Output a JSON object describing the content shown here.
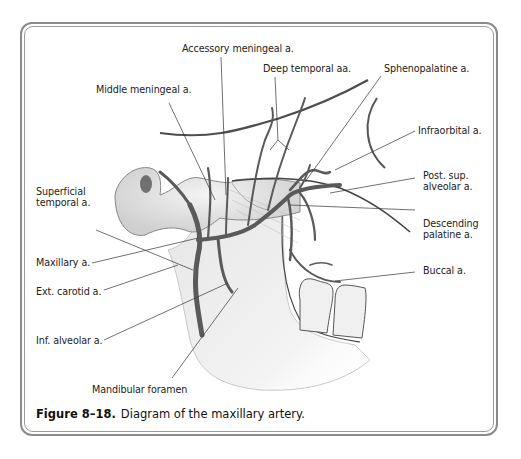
{
  "figure": {
    "number": "Figure 8–18.",
    "caption": "Diagram of the maxillary artery."
  },
  "labels": {
    "accessory_meningeal": "Accessory meningeal a.",
    "deep_temporal": "Deep temporal aa.",
    "sphenopalatine": "Sphenopalatine a.",
    "middle_meningeal": "Middle meningeal a.",
    "infraorbital": "Infraorbital a.",
    "post_sup_alveolar": "Post. sup.\nalveolar a.",
    "superficial_temporal": "Superficial\ntemporal a.",
    "descending_palatine": "Descending\npalatine a.",
    "maxillary": "Maxillary a.",
    "buccal": "Buccal a.",
    "ext_carotid": "Ext. carotid a.",
    "inf_alveolar": "Inf. alveolar a.",
    "mandibular_foramen": "Mandibular foramen"
  },
  "colors": {
    "frame": "#8a8a8a",
    "artery": "#5a5a5a",
    "leader": "#333333",
    "bone_shade": "#d8d8d8"
  }
}
